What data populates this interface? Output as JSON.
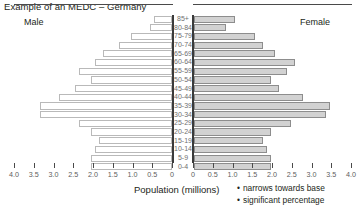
{
  "title": "Example of an MEDC – Germany",
  "labels": {
    "male": "Male",
    "female": "Female",
    "axis_title": "Population (millions)"
  },
  "annotations": [
    "narrows towards base",
    "significant percentage"
  ],
  "bullet_glyph": "•",
  "colors": {
    "male_bar_fill": "#ffffff",
    "male_bar_border": "#b9b9b9",
    "female_bar_fill": "#d2d2d2",
    "female_bar_border": "#8d8d8d",
    "axis": "#3a3a3a",
    "text": "#231f20",
    "tick_text": "#5d5d5d",
    "age_text": "#6f6f6f",
    "background": "#ffffff"
  },
  "chart_data": {
    "type": "bar",
    "subtype": "population-pyramid",
    "title": "Example of an MEDC – Germany",
    "xlabel": "Population (millions)",
    "ylabel": "",
    "xlim": [
      0,
      4.0
    ],
    "xticks": [
      0,
      0.5,
      1.0,
      1.5,
      2.0,
      2.5,
      3.0,
      3.5,
      4.0
    ],
    "xticklabels_left": [
      "4.0",
      "3.5",
      "3.0",
      "2.5",
      "2.0",
      "1.5",
      "1.0",
      "0.5",
      "0"
    ],
    "xticklabels_right": [
      "0",
      "0.5",
      "1.0",
      "1.5",
      "2.0",
      "2.5",
      "3.0",
      "3.5",
      "4.0"
    ],
    "grid": false,
    "legend": "none",
    "categories": [
      "85+",
      "80-84",
      "75-79",
      "70-74",
      "65-69",
      "60-64",
      "55-59",
      "50-54",
      "45-49",
      "40-44",
      "35-39",
      "30-34",
      "25-29",
      "20-24",
      "15-19",
      "10-14",
      "5-9",
      "0-4"
    ],
    "series": [
      {
        "name": "Male",
        "side": "left",
        "values": [
          0.45,
          0.55,
          1.05,
          1.35,
          1.75,
          1.95,
          2.35,
          2.05,
          2.45,
          2.85,
          3.35,
          3.35,
          2.35,
          2.05,
          1.85,
          1.95,
          2.05,
          2.05
        ]
      },
      {
        "name": "Female",
        "side": "right",
        "values": [
          1.05,
          0.8,
          1.55,
          1.75,
          2.05,
          2.55,
          2.35,
          1.95,
          2.15,
          2.75,
          3.45,
          3.35,
          2.45,
          1.95,
          1.75,
          1.85,
          1.95,
          1.95
        ]
      }
    ]
  }
}
